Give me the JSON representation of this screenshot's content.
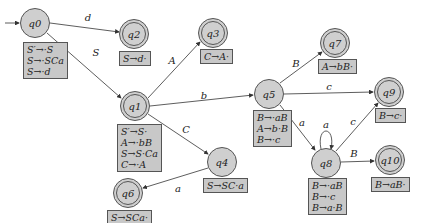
{
  "states": [
    {
      "id": "q0",
      "label": "q0",
      "accept": false,
      "x": 35,
      "y": 23,
      "items": [
        "S′→·S",
        "S→·SCa",
        "S→·d"
      ]
    },
    {
      "id": "q1",
      "label": "q1",
      "accept": true,
      "x": 135,
      "y": 106,
      "items": [
        "S′→S·",
        "A→·bB",
        "S→S·Ca",
        "C→·A"
      ]
    },
    {
      "id": "q2",
      "label": "q2",
      "accept": true,
      "x": 134,
      "y": 34,
      "items": [
        "S→d·"
      ]
    },
    {
      "id": "q3",
      "label": "q3",
      "accept": true,
      "x": 213,
      "y": 33,
      "items": [
        "C→A·"
      ]
    },
    {
      "id": "q4",
      "label": "q4",
      "accept": false,
      "x": 222,
      "y": 162,
      "items": [
        "S→SC·a"
      ]
    },
    {
      "id": "q5",
      "label": "q5",
      "accept": false,
      "x": 269,
      "y": 94,
      "items": [
        "B→·aB",
        "A→b·B",
        "B→·c"
      ]
    },
    {
      "id": "q6",
      "label": "q6",
      "accept": true,
      "x": 128,
      "y": 193,
      "items": [
        "S→SCa·"
      ]
    },
    {
      "id": "q7",
      "label": "q7",
      "accept": true,
      "x": 335,
      "y": 43,
      "items": [
        "A→bB·"
      ]
    },
    {
      "id": "q8",
      "label": "q8",
      "accept": false,
      "x": 326,
      "y": 163,
      "items": [
        "B→·aB",
        "B→·c",
        "B→a·B"
      ]
    },
    {
      "id": "q9",
      "label": "q9",
      "accept": true,
      "x": 389,
      "y": 92,
      "items": [
        "B→c·"
      ]
    },
    {
      "id": "q10",
      "label": "q10",
      "accept": true,
      "x": 390,
      "y": 160,
      "items": [
        "B→aB·"
      ]
    }
  ],
  "edges": [
    {
      "from": "start",
      "to": "q0",
      "label": ""
    },
    {
      "from": "q0",
      "to": "q2",
      "label": "d"
    },
    {
      "from": "q0",
      "to": "q1",
      "label": "S"
    },
    {
      "from": "q1",
      "to": "q3",
      "label": "A"
    },
    {
      "from": "q1",
      "to": "q5",
      "label": "b"
    },
    {
      "from": "q1",
      "to": "q4",
      "label": "C"
    },
    {
      "from": "q4",
      "to": "q6",
      "label": "a"
    },
    {
      "from": "q5",
      "to": "q7",
      "label": "B"
    },
    {
      "from": "q5",
      "to": "q9",
      "label": "c"
    },
    {
      "from": "q5",
      "to": "q8",
      "label": "a"
    },
    {
      "from": "q8",
      "to": "q8",
      "label": "a"
    },
    {
      "from": "q8",
      "to": "q9",
      "label": "c"
    },
    {
      "from": "q8",
      "to": "q10",
      "label": "B"
    }
  ]
}
